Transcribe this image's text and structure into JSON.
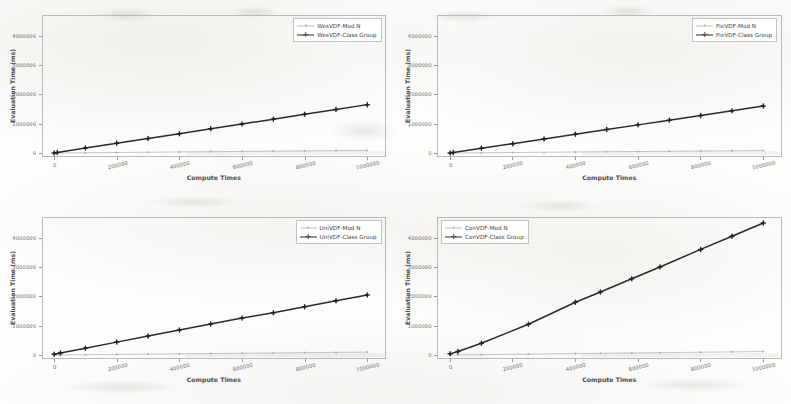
{
  "figure": {
    "background_color": "#fdfdfc",
    "axis_color": "#b9b9b9",
    "series_color_mod_n": "#8c8c8c",
    "series_color_class_group": "#1f1f1f",
    "panel_count": 4
  },
  "axes_common": {
    "xlabel": "Compute Times",
    "ylabel": "Evaluation Time (ms)",
    "xticks": [
      "0",
      "200000",
      "400000",
      "600000",
      "800000",
      "1000000"
    ],
    "xtick_values": [
      0,
      200000,
      400000,
      600000,
      800000,
      1000000
    ],
    "yticks": [
      "0",
      "1000000",
      "2000000",
      "3000000",
      "4000000"
    ],
    "ytick_values": [
      0,
      1000000,
      2000000,
      3000000,
      4000000
    ],
    "xlim": [
      -40000,
      1060000
    ],
    "ylim": [
      -120000,
      4700000
    ],
    "grid": false
  },
  "chart_data": [
    {
      "type": "line",
      "panel": "top-left",
      "title": "",
      "xlabel": "Compute Times",
      "ylabel": "Evaluation Time (ms)",
      "xlim": [
        -40000,
        1060000
      ],
      "ylim": [
        -120000,
        4700000
      ],
      "legend_position": "upper right",
      "x": [
        0,
        10000,
        100000,
        200000,
        300000,
        400000,
        500000,
        600000,
        700000,
        800000,
        900000,
        1000000
      ],
      "series": [
        {
          "name": "WesVDF-Mod N",
          "marker": "circle",
          "color": "#8c8c8c",
          "values": [
            0,
            1200,
            9000,
            18000,
            27000,
            36000,
            45000,
            54000,
            63000,
            72000,
            81000,
            90000
          ]
        },
        {
          "name": "WesVDF-Class Group",
          "marker": "plus",
          "color": "#1f1f1f",
          "values": [
            0,
            18000,
            168000,
            330000,
            495000,
            660000,
            825000,
            990000,
            1155000,
            1320000,
            1485000,
            1650000
          ]
        }
      ]
    },
    {
      "type": "line",
      "panel": "top-right",
      "title": "",
      "xlabel": "Compute Times",
      "ylabel": "Evaluation Time (ms)",
      "xlim": [
        -40000,
        1060000
      ],
      "ylim": [
        -120000,
        4700000
      ],
      "legend_position": "upper right",
      "x": [
        0,
        10000,
        100000,
        200000,
        300000,
        400000,
        500000,
        600000,
        700000,
        800000,
        900000,
        1000000
      ],
      "series": [
        {
          "name": "PieVDF-Mod N",
          "marker": "circle",
          "color": "#8c8c8c",
          "values": [
            0,
            1100,
            8500,
            17000,
            25500,
            34000,
            42500,
            51000,
            59500,
            68000,
            76500,
            85000
          ]
        },
        {
          "name": "PieVDF-Class Group",
          "marker": "plus",
          "color": "#1f1f1f",
          "values": [
            0,
            17000,
            162000,
            320000,
            480000,
            640000,
            800000,
            960000,
            1120000,
            1280000,
            1440000,
            1600000
          ]
        }
      ]
    },
    {
      "type": "line",
      "panel": "bottom-left",
      "title": "",
      "xlabel": "Compute Times",
      "ylabel": "Evaluation Time (ms)",
      "xlim": [
        -40000,
        1060000
      ],
      "ylim": [
        -120000,
        4700000
      ],
      "legend_position": "upper right",
      "x": [
        0,
        20000,
        100000,
        200000,
        300000,
        400000,
        500000,
        600000,
        700000,
        800000,
        900000,
        1000000
      ],
      "values_note": "Class Group reaches about 2050000 at x=1000000",
      "series": [
        {
          "name": "UniVDF-Mod N",
          "marker": "circle",
          "color": "#8c8c8c",
          "values": [
            0,
            2000,
            10000,
            20000,
            30000,
            40000,
            50000,
            60000,
            70000,
            80000,
            90000,
            100000
          ]
        },
        {
          "name": "UniVDF-Class Group",
          "marker": "plus",
          "color": "#1f1f1f",
          "values": [
            30000,
            70000,
            235000,
            440000,
            645000,
            850000,
            1055000,
            1260000,
            1440000,
            1645000,
            1850000,
            2050000
          ]
        }
      ]
    },
    {
      "type": "line",
      "panel": "bottom-right",
      "title": "",
      "xlabel": "Compute Times",
      "ylabel": "Evaluation Time (ms)",
      "xlim": [
        -40000,
        1060000
      ],
      "ylim": [
        -120000,
        4700000
      ],
      "legend_position": "upper left",
      "x": [
        0,
        25000,
        100000,
        250000,
        400000,
        480000,
        580000,
        670000,
        800000,
        900000,
        1000000
      ],
      "values_note": "Class Group rises steeply to about 4500000 at x=1000000",
      "series": [
        {
          "name": "ConVDF-Mod N",
          "marker": "circle",
          "color": "#8c8c8c",
          "values": [
            0,
            3000,
            12000,
            30000,
            48000,
            58000,
            70000,
            80000,
            96000,
            108000,
            120000
          ]
        },
        {
          "name": "ConVDF-Class Group",
          "marker": "plus",
          "color": "#1f1f1f",
          "values": [
            40000,
            120000,
            400000,
            1050000,
            1800000,
            2150000,
            2600000,
            3000000,
            3600000,
            4050000,
            4500000
          ]
        }
      ]
    }
  ]
}
